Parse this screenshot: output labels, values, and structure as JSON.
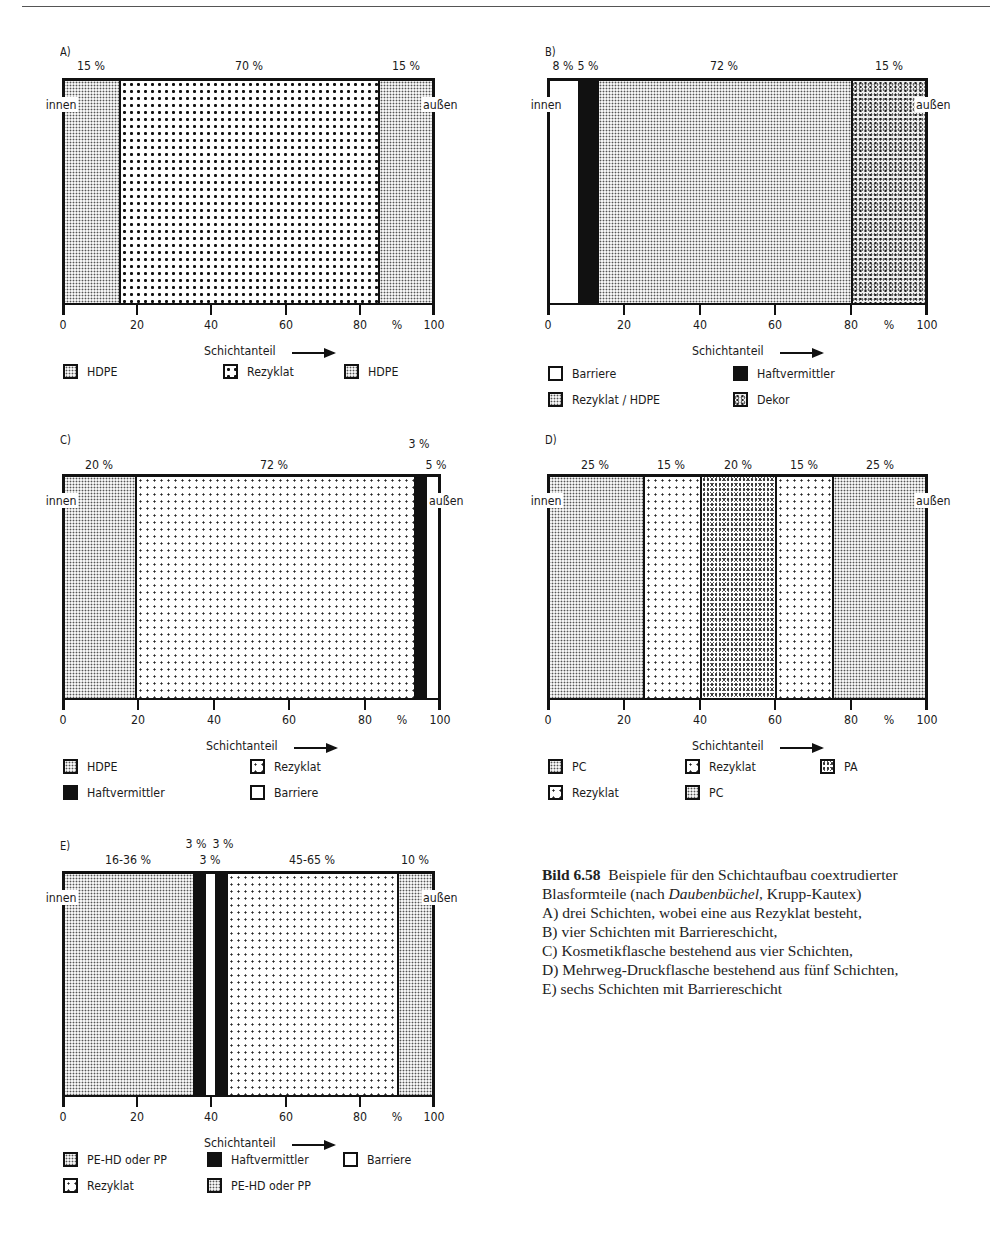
{
  "page": {
    "header_fragment": "Blasformen / Coextrusion (partially cut off)"
  },
  "axis": {
    "ticks": [
      "0",
      "20",
      "40",
      "60",
      "80",
      "100"
    ],
    "unit": "%",
    "title": "Schichtanteil",
    "inner_label": "innen",
    "outer_label": "außen"
  },
  "caption": {
    "figure": "Bild 6.58",
    "title_pre": "Beispiele für den Schichtaufbau coextrudierter Blasformteile (nach ",
    "title_italic": "Daubenbüchel",
    "title_post": ", Krupp-Kautex)",
    "lines": [
      "A) drei Schichten, wobei eine aus Rezyklat besteht,",
      "B) vier Schichten mit Barriereschicht,",
      "C) Kosmetikflasche bestehend aus vier Schichten,",
      "D) Mehrweg-Druckflasche bestehend aus fünf Schichten,",
      "E) sechs Schichten mit Barriereschicht"
    ]
  },
  "chart_data": [
    {
      "id": "A",
      "type": "stacked-bar-horizontal",
      "title": "A)",
      "xlabel": "Schichtanteil",
      "xunit": "%",
      "xlim": [
        0,
        100
      ],
      "layers": [
        {
          "name": "HDPE",
          "start": 0,
          "end": 15,
          "label": "15%",
          "pattern": "fine"
        },
        {
          "name": "Rezyklat",
          "start": 15,
          "end": 85,
          "label": "70%",
          "pattern": "coarse"
        },
        {
          "name": "HDPE",
          "start": 85,
          "end": 100,
          "label": "15%",
          "pattern": "fine"
        }
      ],
      "legend": [
        {
          "text": "HDPE",
          "pattern": "fine"
        },
        {
          "text": "Rezyklat",
          "pattern": "coarse"
        },
        {
          "text": "HDPE",
          "pattern": "fine"
        }
      ]
    },
    {
      "id": "B",
      "type": "stacked-bar-horizontal",
      "title": "B)",
      "xlabel": "Schichtanteil",
      "xunit": "%",
      "xlim": [
        0,
        100
      ],
      "layers": [
        {
          "name": "Barriere",
          "start": 0,
          "end": 8,
          "label": "8%",
          "pattern": "white"
        },
        {
          "name": "Haftvermittler",
          "start": 8,
          "end": 13,
          "label": "5%",
          "pattern": "black"
        },
        {
          "name": "Rezyklat / HDPE",
          "start": 13,
          "end": 80,
          "label": "72%",
          "pattern": "fine"
        },
        {
          "name": "Dekor",
          "start": 80,
          "end": 100,
          "label": "15%",
          "pattern": "dekor"
        }
      ],
      "legend": [
        {
          "text": "Barriere",
          "pattern": "white"
        },
        {
          "text": "Haftvermittler",
          "pattern": "black"
        },
        {
          "text": "Rezyklat / HDPE",
          "pattern": "fine"
        },
        {
          "text": "Dekor",
          "pattern": "dekor"
        }
      ]
    },
    {
      "id": "C",
      "type": "stacked-bar-horizontal",
      "title": "C)",
      "xlabel": "Schichtanteil",
      "xunit": "%",
      "xlim": [
        0,
        100
      ],
      "layers": [
        {
          "name": "HDPE",
          "start": 0,
          "end": 19,
          "label": "20%",
          "pattern": "fine"
        },
        {
          "name": "Rezyklat",
          "start": 19,
          "end": 93,
          "label": "72%",
          "pattern": "sparse"
        },
        {
          "name": "Haftvermittler",
          "start": 93,
          "end": 96,
          "label": "3%",
          "pattern": "black"
        },
        {
          "name": "Barriere",
          "start": 96,
          "end": 100,
          "label": "5%",
          "pattern": "white"
        }
      ],
      "legend": [
        {
          "text": "HDPE",
          "pattern": "fine"
        },
        {
          "text": "Rezyklat",
          "pattern": "sparse"
        },
        {
          "text": "Haftvermittler",
          "pattern": "black"
        },
        {
          "text": "Barriere",
          "pattern": "white"
        }
      ]
    },
    {
      "id": "D",
      "type": "stacked-bar-horizontal",
      "title": "D)",
      "xlabel": "Schichtanteil",
      "xunit": "%",
      "xlim": [
        0,
        100
      ],
      "layers": [
        {
          "name": "PC",
          "start": 0,
          "end": 25,
          "label": "25%",
          "pattern": "fine"
        },
        {
          "name": "Rezyklat",
          "start": 25,
          "end": 40,
          "label": "15%",
          "pattern": "sparse"
        },
        {
          "name": "PA",
          "start": 40,
          "end": 60,
          "label": "20%",
          "pattern": "noise"
        },
        {
          "name": "Rezyklat",
          "start": 60,
          "end": 75,
          "label": "15%",
          "pattern": "sparse"
        },
        {
          "name": "PC",
          "start": 75,
          "end": 100,
          "label": "25%",
          "pattern": "fine"
        }
      ],
      "legend": [
        {
          "text": "PC",
          "pattern": "fine"
        },
        {
          "text": "Rezyklat",
          "pattern": "sparse"
        },
        {
          "text": "PA",
          "pattern": "noise"
        },
        {
          "text": "Rezyklat",
          "pattern": "sparse"
        },
        {
          "text": "PC",
          "pattern": "fine"
        }
      ]
    },
    {
      "id": "E",
      "type": "stacked-bar-horizontal",
      "title": "E)",
      "xlabel": "Schichtanteil",
      "xunit": "%",
      "xlim": [
        0,
        100
      ],
      "layers": [
        {
          "name": "PE-HD oder PP",
          "start": 0,
          "end": 35,
          "label": "16-36%",
          "pattern": "fine"
        },
        {
          "name": "Haftvermittler",
          "start": 35,
          "end": 38,
          "label": "3%",
          "pattern": "black"
        },
        {
          "name": "Barriere",
          "start": 38,
          "end": 41,
          "label": "3%",
          "pattern": "white"
        },
        {
          "name": "Haftvermittler",
          "start": 41,
          "end": 44,
          "label": "3%",
          "pattern": "black"
        },
        {
          "name": "Rezyklat",
          "start": 44,
          "end": 90,
          "label": "45-65%",
          "pattern": "sparse"
        },
        {
          "name": "PE-HD oder PP",
          "start": 90,
          "end": 100,
          "label": "10%",
          "pattern": "fine"
        }
      ],
      "legend": [
        {
          "text": "PE-HD oder PP",
          "pattern": "fine"
        },
        {
          "text": "Haftvermittler",
          "pattern": "black"
        },
        {
          "text": "Barriere",
          "pattern": "white"
        },
        {
          "text": "Rezyklat",
          "pattern": "sparse"
        },
        {
          "text": "PE-HD oder PP",
          "pattern": "fine"
        }
      ]
    }
  ]
}
